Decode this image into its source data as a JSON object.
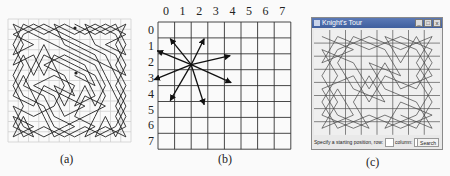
{
  "panels": {
    "a": {
      "caption": "(a)"
    },
    "b": {
      "caption": "(b)",
      "col_labels": [
        "0",
        "1",
        "2",
        "3",
        "4",
        "5",
        "6",
        "7"
      ],
      "row_labels": [
        "0",
        "1",
        "2",
        "3",
        "4",
        "5",
        "6",
        "7"
      ],
      "knight_position": {
        "row": 3,
        "col": 2
      }
    },
    "c": {
      "caption": "(c)",
      "window_title": "Knight's Tour",
      "window_buttons": {
        "minimize": "_",
        "maximize": "□",
        "close": "x"
      },
      "prompt_label": "Specify a starting position, row:",
      "row_value": "",
      "column_label": "column:",
      "column_value": "",
      "search_label": "Search"
    }
  },
  "colors": {
    "grid_light": "#cfcfcf",
    "line": "#222222",
    "titlebar": "#4a69a8"
  }
}
